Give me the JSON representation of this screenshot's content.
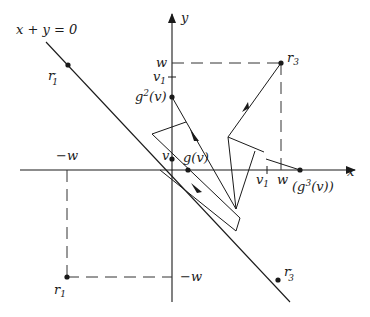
{
  "figure": {
    "line_label": "x + y = 0",
    "axis_x_label": "x",
    "axis_y_label": "y",
    "labels": {
      "r1_prime": "r",
      "r1_prime_sub": "1",
      "r1_prime_mark": "′",
      "r1": "r",
      "r1_sub": "1",
      "r3": "r",
      "r3_sub": "3",
      "r3_prime": "r",
      "r3_prime_sub": "3",
      "r3_prime_mark": "′",
      "w_y": "w",
      "v1_y": "v",
      "v1_y_sub": "1",
      "g2v": "g",
      "g2v_sup": "2",
      "g2v_arg": "(v)",
      "v": "v",
      "gv": "g(v)",
      "neg_w_x": "−w",
      "neg_w_y": "−w",
      "v1_x": "v",
      "v1_x_sub": "1",
      "w_x": "w",
      "g3v": "(g",
      "g3v_sup": "3",
      "g3v_arg": "(v))"
    },
    "colors": {
      "stroke": "#1a1a1a",
      "dash": "#333333"
    }
  }
}
